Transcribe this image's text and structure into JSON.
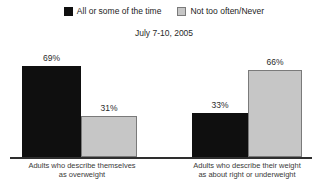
{
  "subtitle": "July 7-10, 2005",
  "chart_data": {
    "type": "bar",
    "title": "",
    "subtitle": "July 7-10, 2005",
    "categories": [
      "Adults who describe themselves as overweight",
      "Adults who describe their weight as about right or underweight"
    ],
    "series": [
      {
        "name": "All or some of the time",
        "color": "#0f0f0f",
        "values": [
          69,
          33
        ]
      },
      {
        "name": "Not too often/Never",
        "color": "#c6c6c6",
        "values": [
          31,
          66
        ]
      }
    ],
    "bars": [
      {
        "group": 0,
        "series": 0,
        "value": 69,
        "label": "69%"
      },
      {
        "group": 0,
        "series": 1,
        "value": 31,
        "label": "31%"
      },
      {
        "group": 1,
        "series": 0,
        "value": 33,
        "label": "33%"
      },
      {
        "group": 1,
        "series": 1,
        "value": 66,
        "label": "66%"
      }
    ],
    "xlabel": "",
    "ylabel": "",
    "ylim": [
      0,
      100
    ],
    "grid": false,
    "legend_position": "top",
    "value_label_format": "percent"
  },
  "x_axis": {
    "group_labels": [
      {
        "line1": "Adults who describe themselves",
        "line2": "as overweight"
      },
      {
        "line1": "Adults who describe their weight",
        "line2": "as about right or underweight"
      }
    ]
  },
  "colors": {
    "series_all_or_some": "#0f0f0f",
    "series_not_too_often": "#c6c6c6",
    "gray_bar_border": "#7a7a7a",
    "axis_line": "#2e2e2e",
    "background": "#ffffff"
  }
}
